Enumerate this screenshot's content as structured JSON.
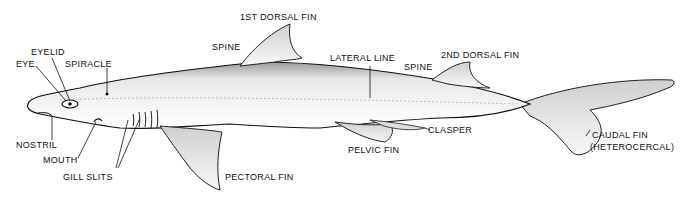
{
  "diagram": {
    "labels": {
      "first_dorsal_fin": "1ST DORSAL FIN",
      "spine_front": "SPINE",
      "eyelid": "EYELID",
      "eye": "EYE",
      "spiracle": "SPIRACLE",
      "lateral_line": "LATERAL LINE",
      "second_dorsal_fin": "2ND DORSAL FIN",
      "spine_rear": "SPINE",
      "nostril": "NOSTRIL",
      "mouth": "MOUTH",
      "gill_slits": "GILL SLITS",
      "pectoral_fin": "PECTORAL FIN",
      "pelvic_fin": "PELVIC FIN",
      "clasper": "CLASPER",
      "caudal_fin": "CAUDAL FIN",
      "caudal_fin_type": "(HETEROCERCAL)"
    },
    "colors": {
      "ink": "#111111",
      "fill": "#f2f2f2",
      "background": "#ffffff"
    }
  }
}
